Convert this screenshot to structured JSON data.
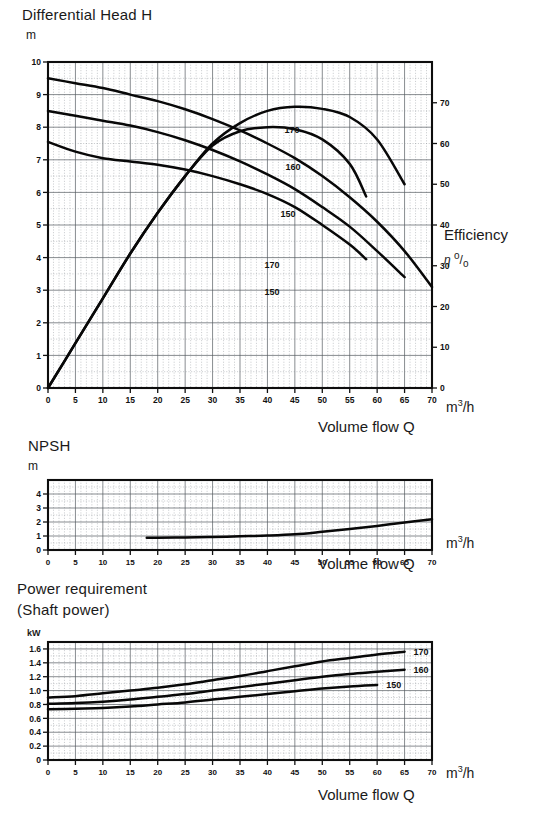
{
  "charts": {
    "head": {
      "title": "Differential Head H",
      "y_unit": "m",
      "x_unit_html": "m3/h",
      "x_caption": "Volume flow Q",
      "right_title": "Efficiency",
      "right_unit_html": "n %",
      "y_ticks": [
        "10",
        "9",
        "8",
        "7",
        "6",
        "5",
        "4",
        "3",
        "2",
        "1",
        "0"
      ],
      "x_ticks": [
        "0",
        "5",
        "10",
        "15",
        "20",
        "25",
        "30",
        "35",
        "40",
        "45",
        "50",
        "55",
        "60",
        "65",
        "70"
      ],
      "right_ticks": [
        "70",
        "60",
        "50",
        "40",
        "30",
        "20",
        "10",
        "0"
      ]
    },
    "npsh": {
      "title": "NPSH",
      "y_unit": "m",
      "x_unit_html": "m3/h",
      "x_caption": "Volume flow Q",
      "y_ticks": [
        "4",
        "3",
        "2",
        "1",
        "0"
      ],
      "x_ticks": [
        "0",
        "5",
        "10",
        "15",
        "20",
        "25",
        "30",
        "35",
        "40",
        "45",
        "50",
        "55",
        "60",
        "65",
        "70"
      ]
    },
    "power": {
      "title_line1": "Power requirement",
      "title_line2": "(Shaft power)",
      "y_unit": "kW",
      "x_unit_html": "m3/h",
      "x_caption": "Volume flow Q",
      "y_ticks": [
        "1.6",
        "1.4",
        "1.2",
        "1.0",
        "0.8",
        "0.6",
        "0.4",
        "0.2",
        "0"
      ],
      "x_ticks": [
        "0",
        "5",
        "10",
        "15",
        "20",
        "25",
        "30",
        "35",
        "40",
        "45",
        "50",
        "55",
        "60",
        "65",
        "70"
      ]
    }
  },
  "chart_data": [
    {
      "type": "line",
      "id": "differential-head",
      "title": "Differential Head H",
      "xlabel": "Volume flow Q",
      "xunit": "m³/h",
      "ylabel": "Differential Head H",
      "yunit": "m",
      "xlim": [
        0,
        70
      ],
      "ylim": [
        0,
        10
      ],
      "grid": true,
      "y2label": "Efficiency",
      "y2unit": "%",
      "y2lim": [
        0,
        80
      ],
      "y2_ticks": [
        0,
        10,
        20,
        30,
        40,
        50,
        60,
        70
      ],
      "legend": "inline curve labels",
      "series": [
        {
          "name": "170",
          "kind": "head",
          "x": [
            0,
            5,
            10,
            15,
            20,
            25,
            30,
            35,
            40,
            45,
            50,
            55,
            60,
            65,
            70
          ],
          "values": [
            9.5,
            9.35,
            9.2,
            9.0,
            8.8,
            8.55,
            8.25,
            7.9,
            7.5,
            7.05,
            6.5,
            5.85,
            5.1,
            4.2,
            3.1
          ]
        },
        {
          "name": "160",
          "kind": "head",
          "x": [
            0,
            5,
            10,
            15,
            20,
            25,
            30,
            35,
            40,
            45,
            50,
            55,
            60,
            65
          ],
          "values": [
            8.5,
            8.35,
            8.2,
            8.05,
            7.85,
            7.6,
            7.3,
            6.95,
            6.55,
            6.1,
            5.55,
            4.95,
            4.2,
            3.4
          ]
        },
        {
          "name": "150",
          "kind": "head",
          "x": [
            0,
            5,
            10,
            15,
            20,
            25,
            30,
            35,
            40,
            45,
            50,
            55,
            58
          ],
          "values": [
            7.55,
            7.25,
            7.05,
            6.95,
            6.85,
            6.7,
            6.5,
            6.25,
            5.95,
            5.55,
            5.0,
            4.4,
            3.95
          ]
        },
        {
          "name": "170",
          "kind": "efficiency",
          "x": [
            0,
            5,
            10,
            15,
            20,
            25,
            30,
            35,
            40,
            45,
            50,
            55,
            60,
            65
          ],
          "values": [
            0,
            11,
            22,
            33,
            43,
            52,
            60,
            65,
            68,
            69,
            68.5,
            66.5,
            61,
            50
          ]
        },
        {
          "name": "150",
          "kind": "efficiency",
          "x": [
            0,
            5,
            10,
            15,
            20,
            25,
            30,
            35,
            40,
            45,
            50,
            55,
            58
          ],
          "values": [
            0,
            11,
            22,
            33,
            43,
            52,
            59.5,
            63,
            64,
            63.5,
            61,
            55,
            47
          ]
        }
      ]
    },
    {
      "type": "line",
      "id": "npsh",
      "title": "NPSH",
      "xlabel": "Volume flow Q",
      "xunit": "m³/h",
      "ylabel": "NPSH",
      "yunit": "m",
      "xlim": [
        0,
        70
      ],
      "ylim": [
        0,
        5
      ],
      "grid": true,
      "series": [
        {
          "name": "NPSH",
          "x": [
            18,
            20,
            25,
            30,
            35,
            40,
            45,
            50,
            55,
            60,
            65,
            70
          ],
          "values": [
            0.88,
            0.88,
            0.9,
            0.93,
            0.98,
            1.03,
            1.12,
            1.3,
            1.5,
            1.72,
            1.97,
            2.2
          ]
        }
      ]
    },
    {
      "type": "line",
      "id": "power-requirement",
      "title": "Power requirement (Shaft power)",
      "xlabel": "Volume flow Q",
      "xunit": "m³/h",
      "ylabel": "Power requirement",
      "yunit": "kW",
      "xlim": [
        0,
        70
      ],
      "ylim": [
        0,
        1.7
      ],
      "grid": true,
      "series": [
        {
          "name": "170",
          "x": [
            0,
            5,
            10,
            15,
            20,
            25,
            30,
            35,
            40,
            45,
            50,
            55,
            60,
            65
          ],
          "values": [
            0.9,
            0.92,
            0.96,
            1.0,
            1.04,
            1.09,
            1.15,
            1.21,
            1.28,
            1.35,
            1.42,
            1.47,
            1.52,
            1.56
          ]
        },
        {
          "name": "160",
          "x": [
            0,
            5,
            10,
            15,
            20,
            25,
            30,
            35,
            40,
            45,
            50,
            55,
            60,
            65
          ],
          "values": [
            0.81,
            0.82,
            0.84,
            0.87,
            0.91,
            0.95,
            1.0,
            1.05,
            1.1,
            1.15,
            1.2,
            1.24,
            1.27,
            1.3
          ]
        },
        {
          "name": "150",
          "x": [
            0,
            5,
            10,
            15,
            20,
            25,
            30,
            35,
            40,
            45,
            50,
            55,
            60
          ],
          "values": [
            0.73,
            0.74,
            0.75,
            0.77,
            0.8,
            0.83,
            0.87,
            0.91,
            0.95,
            0.99,
            1.03,
            1.06,
            1.08
          ]
        }
      ]
    }
  ]
}
